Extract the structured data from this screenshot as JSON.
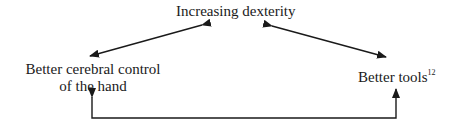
{
  "nodes": {
    "top": {
      "label": "Increasing dexterity"
    },
    "left": {
      "line1": "Better cerebral control",
      "line2": "of the hand"
    },
    "right": {
      "label": "Better tools",
      "footnote": "12"
    }
  },
  "edges": [
    {
      "from": "top",
      "to": "left",
      "type": "bidirectional"
    },
    {
      "from": "top",
      "to": "right",
      "type": "bidirectional"
    },
    {
      "from": "right",
      "to": "left",
      "type": "elbow-bidirectional",
      "route": "below"
    }
  ],
  "colors": {
    "ink": "#1a1a1a",
    "background": "#ffffff"
  }
}
